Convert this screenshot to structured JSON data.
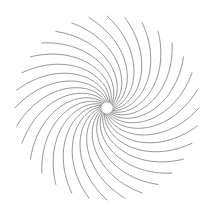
{
  "figure": {
    "background_color": "#ffffff",
    "width": 212,
    "height": 214
  },
  "chart_data": {
    "type": "line",
    "subtitle": "",
    "xlabel": "",
    "ylabel": "",
    "grid": false,
    "legend_position": "none",
    "axis_visible": false,
    "tick_labels": [],
    "annotations": [],
    "plot_style": "polar-spiral-rays",
    "center": {
      "x": 107,
      "y": 108
    },
    "inner_radius": 6,
    "outer_radius": 92,
    "num_arms": 32,
    "arm_angle_step_deg": 11.25,
    "spiral_twist_deg": 95,
    "twist_falloff_exponent": 0.62,
    "samples_per_arm": 60,
    "stroke_color": "#808080",
    "stroke_width": 0.9,
    "stroke_opacity": 0.95,
    "start_angle_deg": 0,
    "arm_start_angles_deg": [
      0,
      11.25,
      22.5,
      33.75,
      45,
      56.25,
      67.5,
      78.75,
      90,
      101.25,
      112.5,
      123.75,
      135,
      146.25,
      157.5,
      168.75,
      180,
      191.25,
      202.5,
      213.75,
      225,
      236.25,
      247.5,
      258.75,
      270,
      281.25,
      292.5,
      303.75,
      315,
      326.25,
      337.5,
      348.75
    ],
    "radial_extent_px": {
      "left": 15,
      "right": 199,
      "top": 13,
      "bottom": 201
    }
  }
}
